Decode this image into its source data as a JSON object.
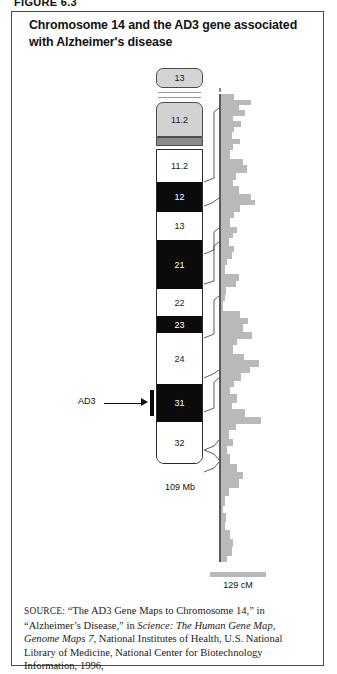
{
  "figure": {
    "number_label": "FIGURE 6.3",
    "title": "Chromosome 14 and the AD3 gene associated with Alzheimer's disease"
  },
  "ideogram": {
    "satellite_label": "13",
    "p_arm_band_label": "11.2",
    "size_label": "109 Mb",
    "bands": [
      {
        "label": "11.2",
        "shade": "white"
      },
      {
        "label": "12",
        "shade": "black"
      },
      {
        "label": "13",
        "shade": "white"
      },
      {
        "label": "21",
        "shade": "black"
      },
      {
        "label": "22",
        "shade": "white"
      },
      {
        "label": "23",
        "shade": "black"
      },
      {
        "label": "24",
        "shade": "white"
      },
      {
        "label": "31",
        "shade": "black"
      },
      {
        "label": "32",
        "shade": "white"
      }
    ]
  },
  "annotation": {
    "gene_label": "AD3"
  },
  "scale": {
    "genetic_length_label": "129 cM"
  },
  "source": {
    "prefix": "SOURCE:",
    "part1": " “The AD3 Gene Maps to Chromosome 14,” in “Alzheimer’s Disease,” in ",
    "italic": "Science: The Human Gene Map, Genome Maps 7",
    "part2": ", National Institutes of Health, U.S. National Library of Medicine, National Center for Biotechnology Information, 1996, http://www.ncbi.nlm.nih.gov/SCIENCE96/gene.cgi?AD3 (accessed September 24, 2010)"
  },
  "chart_data": {
    "type": "bar",
    "orientation": "horizontal",
    "xlabel": "relative gene density",
    "ylabel": "position along chromosome 14",
    "axis_top_value_label": "0 cM",
    "axis_bottom_value_label": "129 cM",
    "ylim": [
      0,
      129
    ],
    "grid": false,
    "legend": "none",
    "note": "Each bar is a genomic window; bar length = number of mapped genes in that window (relative units read off the pixel extent).",
    "bars": [
      {
        "top": 0,
        "height": 6,
        "len": 10
      },
      {
        "top": 6,
        "height": 5,
        "len": 22
      },
      {
        "top": 11,
        "height": 5,
        "len": 13
      },
      {
        "top": 16,
        "height": 6,
        "len": 18
      },
      {
        "top": 22,
        "height": 5,
        "len": 9
      },
      {
        "top": 27,
        "height": 6,
        "len": 15
      },
      {
        "top": 33,
        "height": 5,
        "len": 10
      },
      {
        "top": 38,
        "height": 7,
        "len": 8
      },
      {
        "top": 45,
        "height": 5,
        "len": 14
      },
      {
        "top": 50,
        "height": 6,
        "len": 9
      },
      {
        "top": 56,
        "height": 9,
        "len": 7
      },
      {
        "top": 65,
        "height": 6,
        "len": 16
      },
      {
        "top": 71,
        "height": 8,
        "len": 19
      },
      {
        "top": 79,
        "height": 7,
        "len": 11
      },
      {
        "top": 86,
        "height": 6,
        "len": 9
      },
      {
        "top": 92,
        "height": 8,
        "len": 13
      },
      {
        "top": 100,
        "height": 6,
        "len": 22
      },
      {
        "top": 106,
        "height": 5,
        "len": 25
      },
      {
        "top": 111,
        "height": 7,
        "len": 14
      },
      {
        "top": 118,
        "height": 6,
        "len": 10
      },
      {
        "top": 124,
        "height": 9,
        "len": 7
      },
      {
        "top": 133,
        "height": 6,
        "len": 12
      },
      {
        "top": 139,
        "height": 5,
        "len": 9
      },
      {
        "top": 144,
        "height": 8,
        "len": 6
      },
      {
        "top": 152,
        "height": 6,
        "len": 10
      },
      {
        "top": 158,
        "height": 7,
        "len": 8
      },
      {
        "top": 165,
        "height": 6,
        "len": 5
      },
      {
        "top": 171,
        "height": 9,
        "len": 3
      },
      {
        "top": 180,
        "height": 7,
        "len": 13
      },
      {
        "top": 187,
        "height": 6,
        "len": 11
      },
      {
        "top": 193,
        "height": 8,
        "len": 4
      },
      {
        "top": 201,
        "height": 6,
        "len": 3
      },
      {
        "top": 207,
        "height": 10,
        "len": 2
      },
      {
        "top": 217,
        "height": 7,
        "len": 14
      },
      {
        "top": 224,
        "height": 6,
        "len": 20
      },
      {
        "top": 230,
        "height": 8,
        "len": 16
      },
      {
        "top": 238,
        "height": 7,
        "len": 23
      },
      {
        "top": 245,
        "height": 6,
        "len": 12
      },
      {
        "top": 251,
        "height": 9,
        "len": 9
      },
      {
        "top": 260,
        "height": 6,
        "len": 17
      },
      {
        "top": 266,
        "height": 7,
        "len": 28
      },
      {
        "top": 273,
        "height": 6,
        "len": 21
      },
      {
        "top": 279,
        "height": 8,
        "len": 15
      },
      {
        "top": 287,
        "height": 6,
        "len": 10
      },
      {
        "top": 293,
        "height": 7,
        "len": 7
      },
      {
        "top": 300,
        "height": 9,
        "len": 12
      },
      {
        "top": 309,
        "height": 6,
        "len": 8
      },
      {
        "top": 315,
        "height": 8,
        "len": 18
      },
      {
        "top": 323,
        "height": 7,
        "len": 29
      },
      {
        "top": 330,
        "height": 6,
        "len": 11
      },
      {
        "top": 336,
        "height": 9,
        "len": 6
      },
      {
        "top": 345,
        "height": 7,
        "len": 9
      },
      {
        "top": 352,
        "height": 8,
        "len": 5
      },
      {
        "top": 360,
        "height": 10,
        "len": 7
      },
      {
        "top": 370,
        "height": 8,
        "len": 12
      },
      {
        "top": 378,
        "height": 7,
        "len": 16
      },
      {
        "top": 385,
        "height": 9,
        "len": 13
      },
      {
        "top": 394,
        "height": 8,
        "len": 6
      },
      {
        "top": 402,
        "height": 10,
        "len": 3
      },
      {
        "top": 412,
        "height": 7,
        "len": 2
      },
      {
        "top": 419,
        "height": 9,
        "len": 4
      },
      {
        "top": 428,
        "height": 8,
        "len": 3
      },
      {
        "top": 436,
        "height": 9,
        "len": 7
      },
      {
        "top": 445,
        "height": 8,
        "len": 9
      },
      {
        "top": 453,
        "height": 9,
        "len": 8
      },
      {
        "top": 462,
        "height": 6,
        "len": 5
      }
    ]
  }
}
